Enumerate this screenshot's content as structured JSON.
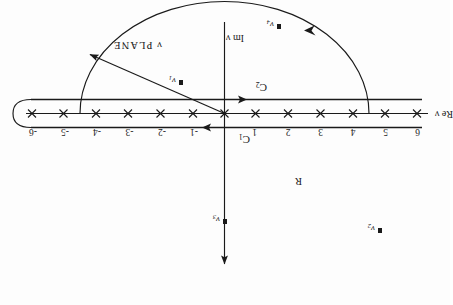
{
  "figure": {
    "plane_label": "ν PLANE",
    "rotation_degrees": 180,
    "background_color": "#fdfdfd",
    "ink_color": "#1a1a1a"
  },
  "axes": {
    "real": {
      "label": "Re ν",
      "tick_labels": [
        "-6",
        "-5",
        "-4",
        "-3",
        "-2",
        "-1",
        "1",
        "2",
        "3",
        "4",
        "5",
        "6"
      ],
      "tick_values": [
        -6,
        -5,
        -4,
        -3,
        -2,
        -1,
        1,
        2,
        3,
        4,
        5,
        6
      ],
      "tick_glyph": "x",
      "origin_glyph": "x"
    },
    "imaginary": {
      "label": "Im ν",
      "arrow": "down"
    }
  },
  "contours": [
    {
      "name": "C1",
      "label": "C",
      "sublabel": "1",
      "direction": "right",
      "position": "above-real-axis"
    },
    {
      "name": "C2",
      "label": "C",
      "sublabel": "2",
      "direction": "left",
      "position": "below-real-axis"
    }
  ],
  "poles": [
    {
      "id": "nu1",
      "label": "ν",
      "sublabel": "1",
      "marker": "filled-square"
    },
    {
      "id": "nu2",
      "label": "ν",
      "sublabel": "2",
      "marker": "filled-square"
    },
    {
      "id": "nu3",
      "label": "ν",
      "sublabel": "3",
      "marker": "filled-square"
    },
    {
      "id": "nu4",
      "label": "ν",
      "sublabel": "4",
      "marker": "filled-square"
    }
  ],
  "radius": {
    "label": "R",
    "description": "radius arrow from origin to semicircle arc"
  },
  "corner_artifact": {
    "text": ""
  }
}
